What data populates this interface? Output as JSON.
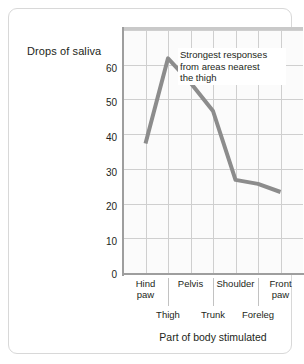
{
  "chart_data": {
    "type": "line",
    "title": "",
    "xlabel": "Part of body stimulated",
    "ylabel": "Drops of saliva",
    "categories": [
      "Hind paw",
      "Thigh",
      "Pelvis",
      "Trunk",
      "Shoulder",
      "Foreleg",
      "Front paw"
    ],
    "values": [
      32,
      53,
      47,
      40,
      23,
      22,
      20
    ],
    "ylim": [
      0,
      60
    ],
    "yticks": [
      0,
      10,
      20,
      30,
      40,
      50,
      60
    ],
    "ytick_labels": [
      "0",
      "10",
      "20",
      "30",
      "40",
      "50",
      "60"
    ],
    "grid": true,
    "legend": "none",
    "line_color": "#8c8c8c",
    "grid_color": "#cfcfcf",
    "plot_background": "#fbfbfb",
    "annotations": [
      {
        "text": "Strongest responses from areas nearest the thigh",
        "line1": "Strongest responses",
        "line2": "from areas nearest",
        "line3": "the thigh"
      }
    ]
  },
  "axis": {
    "y_title": "Drops of saliva",
    "x_title": "Part of body stimulated",
    "y_ticks": [
      {
        "label": "60"
      },
      {
        "label": "50"
      },
      {
        "label": "40"
      },
      {
        "label": "30"
      },
      {
        "label": "20"
      },
      {
        "label": "10"
      },
      {
        "label": "0"
      }
    ],
    "x_labels_top": [
      {
        "line1": "Hind",
        "line2": "paw"
      },
      {
        "line1": "Pelvis",
        "line2": ""
      },
      {
        "line1": "Shoulder",
        "line2": ""
      },
      {
        "line1": "Front",
        "line2": "paw"
      }
    ],
    "x_labels_bottom": [
      {
        "label": "Thigh"
      },
      {
        "label": "Trunk"
      },
      {
        "label": "Foreleg"
      }
    ]
  }
}
